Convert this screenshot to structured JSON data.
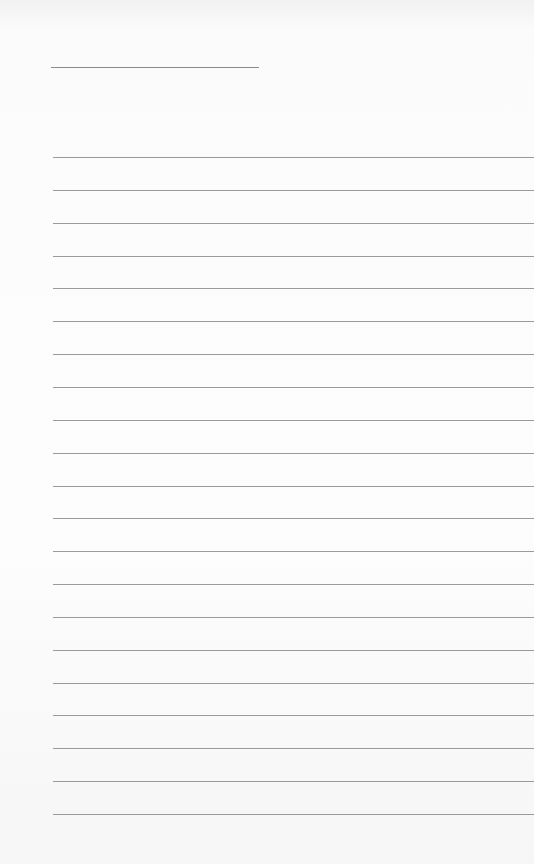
{
  "page": {
    "type": "lined-paper",
    "background_color": "#fbfbfb",
    "line_color": "#9a9a9a",
    "title_line": {
      "x": 51,
      "y": 67,
      "width": 208
    },
    "rules": {
      "count": 21,
      "start_y": 157,
      "spacing": 32.85,
      "left_x": 53
    }
  }
}
